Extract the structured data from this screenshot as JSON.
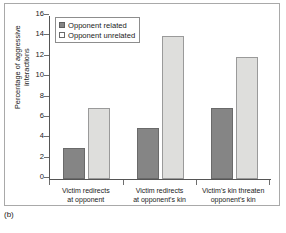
{
  "figure": {
    "caption": "(b)",
    "panel_border_color": "#a9a9a9"
  },
  "legend": {
    "position": "top-left inside plot",
    "entries": [
      {
        "label": "Opponent related",
        "color": "#858585",
        "swatch": "filled-square-icon"
      },
      {
        "label": "Opponent unrelated",
        "color": "#dededc",
        "swatch": "empty-square-icon"
      }
    ]
  },
  "axes": {
    "ylabel_line1": "Percentage of aggressive",
    "ylabel_line2": "interactions",
    "yticks": [
      "0",
      "2",
      "4",
      "6",
      "8",
      "10",
      "12",
      "14",
      "16"
    ]
  },
  "chart_data": {
    "type": "bar",
    "title": "",
    "xlabel": "",
    "ylabel": "Percentage of aggressive interactions",
    "ylim": [
      0,
      16
    ],
    "ytick_values": [
      0,
      2,
      4,
      6,
      8,
      10,
      12,
      14,
      16
    ],
    "grid": false,
    "legend_position": "upper left",
    "categories": [
      "Victim redirects at opponent",
      "Victim redirects at opponent's kin",
      "Victim's kin threaten opponent's kin"
    ],
    "category_lines": [
      [
        "Victim redirects",
        "at opponent"
      ],
      [
        "Victim redirects",
        "at opponent's kin"
      ],
      [
        "Victim's kin threaten",
        "opponent's kin"
      ]
    ],
    "series": [
      {
        "name": "Opponent related",
        "color": "#858585",
        "values": [
          3,
          5,
          7
        ]
      },
      {
        "name": "Opponent unrelated",
        "color": "#dededc",
        "values": [
          7,
          14,
          12
        ]
      }
    ]
  }
}
